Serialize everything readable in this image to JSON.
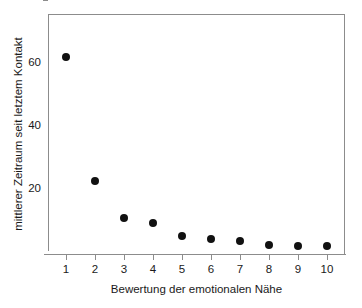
{
  "chart_data": {
    "type": "scatter",
    "title": "",
    "xlabel": "Bewertung der emotionalen Nähe",
    "ylabel": "mittlerer Zeitraum seit letztem Kontakt",
    "x": [
      1,
      2,
      3,
      4,
      5,
      6,
      7,
      8,
      9,
      10
    ],
    "values": [
      61.8,
      22.6,
      10.8,
      9.2,
      5.1,
      4.0,
      3.4,
      2.2,
      1.9,
      1.8
    ],
    "categories": [
      "1",
      "2",
      "3",
      "4",
      "5",
      "6",
      "7",
      "8",
      "9",
      "10"
    ],
    "xtick_labels": [
      "1",
      "2",
      "3",
      "4",
      "5",
      "6",
      "7",
      "8",
      "9",
      "10"
    ],
    "ytick_labels": [
      "20",
      "40",
      "60"
    ],
    "ytick_values": [
      20,
      40,
      60
    ],
    "xlim": [
      0.5,
      10.5
    ],
    "ylim": [
      0,
      76
    ],
    "grid": false,
    "legend": false,
    "marker_color": "#111111",
    "axis_color": "#8c8c8c",
    "background_color": "#ffffff"
  }
}
